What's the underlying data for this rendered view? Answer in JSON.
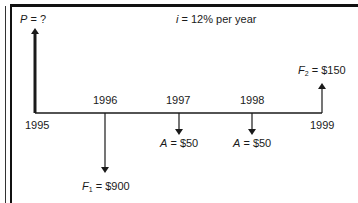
{
  "diagram": {
    "title_var": "i",
    "title_rest": "= 12% per year",
    "present": {
      "var": "P",
      "value": "= ?"
    },
    "years": [
      "1995",
      "1996",
      "1997",
      "1998",
      "1999"
    ],
    "flows": [
      {
        "year": "1996",
        "var": "F",
        "sub": "1",
        "value": "= $900",
        "direction": "down"
      },
      {
        "year": "1997",
        "var": "A",
        "sub": "",
        "value": "= $50",
        "direction": "down"
      },
      {
        "year": "1998",
        "var": "A",
        "sub": "",
        "value": "= $50",
        "direction": "down"
      },
      {
        "year": "1999",
        "var": "F",
        "sub": "2",
        "value": "= $150",
        "direction": "up"
      }
    ],
    "colors": {
      "line": "#1a1a1a",
      "background": "#ffffff"
    }
  }
}
